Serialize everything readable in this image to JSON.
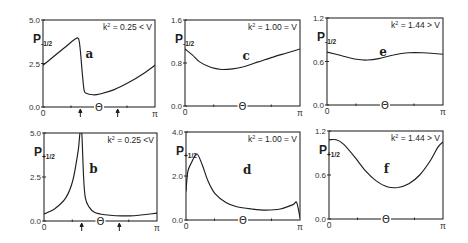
{
  "figure": {
    "x_axis": {
      "symbol": "Θ",
      "tick_labels": [
        "0",
        "π"
      ]
    }
  },
  "panels": [
    {
      "id": "a",
      "letter": "a",
      "ylabel_main": "P",
      "ylabel_sub": "-1/2",
      "condition_k": "k",
      "condition_sup": "2",
      "condition_rest": " = 0.25 < V",
      "yticks": [
        "5.0",
        "2.5",
        "0.0"
      ],
      "arrows": true
    },
    {
      "id": "b",
      "letter": "b",
      "ylabel_main": "P",
      "ylabel_sub": "+1/2",
      "condition_k": "k",
      "condition_sup": "2",
      "condition_rest": " = 0.25 <V",
      "yticks": [
        "5.0",
        "2.5",
        "0.0"
      ],
      "arrows": true
    },
    {
      "id": "c",
      "letter": "c",
      "ylabel_main": "P",
      "ylabel_sub": "-1/2",
      "condition_k": "k",
      "condition_sup": "2",
      "condition_rest": " = 1.00 = V",
      "yticks": [
        "1.6",
        "0.8",
        "0.0"
      ],
      "arrows": false
    },
    {
      "id": "d",
      "letter": "d",
      "ylabel_main": "P",
      "ylabel_sub": "+1/2",
      "condition_k": "k",
      "condition_sup": "2",
      "condition_rest": " = 1.00 = V",
      "yticks": [
        "4.0",
        "2.0",
        "0.0"
      ],
      "arrows": false
    },
    {
      "id": "e",
      "letter": "e",
      "ylabel_main": "P",
      "ylabel_sub": "-1/2",
      "condition_k": "k",
      "condition_sup": "2",
      "condition_rest": " = 1.44 > V",
      "yticks": [
        "1.2",
        "0.6",
        "0.0"
      ],
      "arrows": false
    },
    {
      "id": "f",
      "letter": "f",
      "ylabel_main": "P",
      "ylabel_sub": "+1/2",
      "condition_k": "k",
      "condition_sup": "2",
      "condition_rest": " = 1.44 > V",
      "yticks": [
        "1.2",
        "0.6",
        "0.0"
      ],
      "arrows": false
    }
  ],
  "chart_data": [
    {
      "type": "line",
      "panel": "a",
      "title": "k² = 0.25 < V",
      "xlabel": "Θ",
      "ylabel": "P-1/2",
      "xlim": [
        0,
        3.1416
      ],
      "ylim": [
        0,
        5.0
      ],
      "xticks": [
        "0",
        "π"
      ],
      "yticks": [
        0.0,
        2.5,
        5.0
      ],
      "grid": false,
      "annotations": [
        "arrow at Θ≈π/3",
        "arrow at Θ≈2π/3"
      ],
      "x": [
        0,
        0.3,
        0.6,
        0.9,
        1.0,
        1.05,
        1.1,
        1.15,
        1.2,
        1.4,
        1.6,
        2.0,
        2.4,
        2.8,
        3.1416
      ],
      "values": [
        2.4,
        2.9,
        3.4,
        3.9,
        3.9,
        3.2,
        2.0,
        1.0,
        0.8,
        0.7,
        0.75,
        1.0,
        1.4,
        1.9,
        2.4
      ]
    },
    {
      "type": "line",
      "panel": "b",
      "title": "k² = 0.25 <V",
      "xlabel": "Θ",
      "ylabel": "P+1/2",
      "xlim": [
        0,
        3.1416
      ],
      "ylim": [
        0,
        5.0
      ],
      "xticks": [
        "0",
        "π"
      ],
      "yticks": [
        0.0,
        2.5,
        5.0
      ],
      "grid": false,
      "annotations": [
        "arrow at Θ≈π/3",
        "arrow at Θ≈2π/3",
        "divergence near Θ≈π/3"
      ],
      "x": [
        0,
        0.3,
        0.6,
        0.8,
        0.95,
        1.0,
        1.05,
        1.1,
        1.15,
        1.25,
        1.4,
        1.7,
        2.0,
        2.5,
        3.1416
      ],
      "values": [
        0.4,
        0.7,
        1.3,
        2.3,
        4.0,
        5.0,
        5.0,
        2.5,
        1.3,
        0.8,
        0.5,
        0.35,
        0.3,
        0.3,
        0.45
      ]
    },
    {
      "type": "line",
      "panel": "c",
      "title": "k² = 1.00 = V",
      "xlabel": "Θ",
      "ylabel": "P-1/2",
      "xlim": [
        0,
        3.1416
      ],
      "ylim": [
        0,
        1.6
      ],
      "xticks": [
        "0",
        "π"
      ],
      "yticks": [
        0.0,
        0.8,
        1.6
      ],
      "grid": false,
      "x": [
        0,
        0.2,
        0.4,
        0.7,
        1.0,
        1.3,
        1.6,
        2.0,
        2.4,
        2.8,
        3.1416
      ],
      "values": [
        1.06,
        0.95,
        0.82,
        0.72,
        0.68,
        0.69,
        0.73,
        0.82,
        0.91,
        0.99,
        1.06
      ]
    },
    {
      "type": "line",
      "panel": "d",
      "title": "k² = 1.00 = V",
      "xlabel": "Θ",
      "ylabel": "P+1/2",
      "xlim": [
        0,
        3.1416
      ],
      "ylim": [
        0,
        4.0
      ],
      "xticks": [
        "0",
        "π"
      ],
      "yticks": [
        0.0,
        2.0,
        4.0
      ],
      "grid": false,
      "x": [
        0,
        0.05,
        0.15,
        0.3,
        0.45,
        0.6,
        0.8,
        1.1,
        1.4,
        1.8,
        2.2,
        2.6,
        2.95,
        3.05,
        3.1416
      ],
      "values": [
        1.3,
        2.2,
        2.6,
        3.0,
        2.5,
        1.8,
        1.2,
        0.8,
        0.6,
        0.5,
        0.45,
        0.5,
        0.7,
        0.8,
        0.1
      ]
    },
    {
      "type": "line",
      "panel": "e",
      "title": "k² = 1.44 > V",
      "xlabel": "Θ",
      "ylabel": "P-1/2",
      "xlim": [
        0,
        3.1416
      ],
      "ylim": [
        0,
        1.2
      ],
      "xticks": [
        "0",
        "π"
      ],
      "yticks": [
        0.0,
        0.6,
        1.2
      ],
      "grid": false,
      "x": [
        0,
        0.4,
        0.8,
        1.1,
        1.4,
        1.8,
        2.2,
        2.6,
        3.1416
      ],
      "values": [
        0.73,
        0.68,
        0.63,
        0.62,
        0.64,
        0.69,
        0.72,
        0.72,
        0.7
      ]
    },
    {
      "type": "line",
      "panel": "f",
      "title": "k² = 1.44 > V",
      "xlabel": "Θ",
      "ylabel": "P+1/2",
      "xlim": [
        0,
        3.1416
      ],
      "ylim": [
        0,
        1.2
      ],
      "xticks": [
        "0",
        "π"
      ],
      "yticks": [
        0.0,
        0.6,
        1.2
      ],
      "grid": false,
      "x": [
        0,
        0.2,
        0.4,
        0.7,
        1.0,
        1.3,
        1.6,
        1.9,
        2.2,
        2.5,
        2.8,
        3.0,
        3.1416
      ],
      "values": [
        1.08,
        1.08,
        1.02,
        0.85,
        0.66,
        0.52,
        0.44,
        0.43,
        0.48,
        0.6,
        0.8,
        0.98,
        1.05
      ]
    }
  ]
}
